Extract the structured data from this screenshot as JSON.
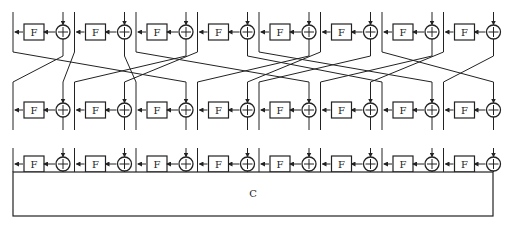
{
  "diagram": {
    "columns": 8,
    "round_function_label": "F",
    "xor_symbol": "⊕",
    "final_block_label": "C",
    "rows": [
      "round-1",
      "round-2",
      "round-3"
    ],
    "permutation": [
      {
        "from": "L0",
        "to": "X2"
      },
      {
        "from": "X0",
        "to": "L0"
      },
      {
        "from": "L1",
        "to": "X0"
      },
      {
        "from": "X1",
        "to": "L2"
      },
      {
        "from": "L2",
        "to": "X4"
      },
      {
        "from": "X2",
        "to": "L1"
      },
      {
        "from": "L3",
        "to": "X1"
      },
      {
        "from": "X3",
        "to": "L6"
      },
      {
        "from": "L4",
        "to": "X6"
      },
      {
        "from": "X4",
        "to": "L3"
      },
      {
        "from": "L5",
        "to": "X3"
      },
      {
        "from": "X5",
        "to": "L4"
      },
      {
        "from": "L6",
        "to": "X7"
      },
      {
        "from": "X6",
        "to": "L5"
      },
      {
        "from": "L7",
        "to": "X5"
      },
      {
        "from": "X7",
        "to": "L7"
      }
    ]
  }
}
